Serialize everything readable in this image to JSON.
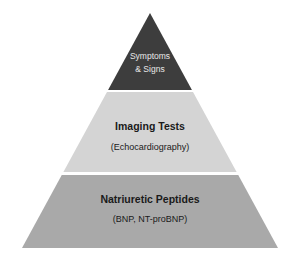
{
  "figure": {
    "name": "diagnostic-pyramid",
    "background_color": "#ffffff",
    "apex": {
      "x": 150,
      "y": 13
    },
    "base_left": {
      "x": 22,
      "y": 248
    },
    "base_right": {
      "x": 278,
      "y": 248
    },
    "divider_color": "#ffffff"
  },
  "tiers": [
    {
      "id": "symptoms",
      "title": "Symptoms",
      "title_line2": "& Signs",
      "subtitle": "",
      "fill_color": "#3d3d3d",
      "text_color": "#e8e8e8",
      "top_y": 13,
      "bottom_y": 90,
      "title_font_size": 8.5,
      "subtitle_font_size": 0
    },
    {
      "id": "imaging",
      "title": "Imaging Tests",
      "title_line2": "",
      "subtitle": "(Echocardiography)",
      "fill_color": "#d4d4d4",
      "text_color": "#1a1a1a",
      "top_y": 92,
      "bottom_y": 172,
      "title_font_size": 10.5,
      "subtitle_font_size": 9
    },
    {
      "id": "natriuretic",
      "title": "Natriuretic Peptides",
      "title_line2": "",
      "subtitle": "(BNP, NT-proBNP)",
      "fill_color": "#a9a9a9",
      "text_color": "#1a1a1a",
      "top_y": 175,
      "bottom_y": 248,
      "title_font_size": 10.5,
      "subtitle_font_size": 9
    }
  ],
  "labels": {
    "tier1_line1": "Symptoms",
    "tier1_line2": "& Signs",
    "tier2_title": "Imaging Tests",
    "tier2_subtitle": "(Echocardiography)",
    "tier3_title": "Natriuretic Peptides",
    "tier3_subtitle": "(BNP, NT-proBNP)"
  }
}
